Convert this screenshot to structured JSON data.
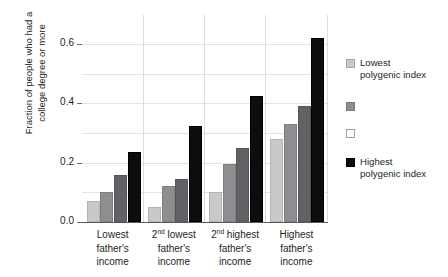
{
  "chart_data": {
    "type": "bar",
    "title": "",
    "subtitle": "",
    "xlabel": "",
    "ylabel": "Fraction of people who had a\ncollege degree or more",
    "ylim": [
      0.0,
      0.65
    ],
    "yticks": [
      0.0,
      0.2,
      0.4,
      0.6
    ],
    "ytick_labels": [
      "0.0",
      "0.2",
      "0.4",
      "0.6"
    ],
    "minor_gridlines": [
      0.1,
      0.3,
      0.5
    ],
    "grid": true,
    "legend_position": "right",
    "categories": [
      "Lowest\nfather's\nincome",
      "2nd lowest\nfather's\nincome",
      "2nd highest\nfather's\nincome",
      "Highest\nfather's\nincome"
    ],
    "category_lines": [
      [
        "Lowest",
        "father's",
        "income"
      ],
      [
        "2nd lowest",
        "father's",
        "income"
      ],
      [
        "2nd highest",
        "father's",
        "income"
      ],
      [
        "Highest",
        "father's",
        "income"
      ]
    ],
    "series": [
      {
        "name": "Lowest polygenic index",
        "color": "#c9c9c7",
        "values": [
          0.07,
          0.05,
          0.1,
          0.28
        ]
      },
      {
        "name": "",
        "color": "#8d8e90",
        "values": [
          0.1,
          0.12,
          0.195,
          0.33
        ]
      },
      {
        "name": "",
        "color": "#616265",
        "values": [
          0.16,
          0.145,
          0.25,
          0.39
        ]
      },
      {
        "name": "Highest polygenic index",
        "color": "#0d0d0d",
        "values": [
          0.235,
          0.325,
          0.425,
          0.62
        ]
      }
    ]
  },
  "legend": {
    "items": [
      {
        "label": "Lowest\npolygenic index",
        "swatch": "light-gray"
      },
      {
        "label": "",
        "swatch": "medium-gray"
      },
      {
        "label": "",
        "swatch": "white"
      },
      {
        "label": "Highest\npolygenic index",
        "swatch": "black"
      }
    ]
  },
  "axis": {
    "y_title_line1": "Fraction of people who had a",
    "y_title_line2": "college degree or more"
  }
}
